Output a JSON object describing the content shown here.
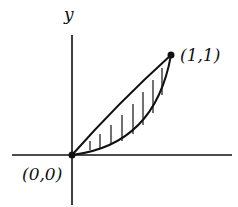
{
  "diagram": {
    "y_axis_label": "y",
    "points": [
      {
        "label": "(0,0)",
        "x": 0,
        "y": 0
      },
      {
        "label": "(1,1)",
        "x": 1,
        "y": 1
      }
    ],
    "region": "shaded region between two curves from (0,0) to (1,1)",
    "hatch": "vertical lines",
    "colors": {
      "ink": "#111111",
      "background": "#ffffff"
    }
  }
}
